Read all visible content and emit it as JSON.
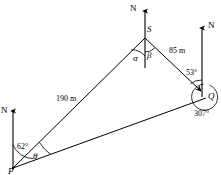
{
  "figure": {
    "type": "geometry-bearing-diagram"
  },
  "points": {
    "p": {
      "label": "P",
      "x": 13,
      "y": 168
    },
    "s": {
      "label": "S",
      "x": 145,
      "y": 38
    },
    "q": {
      "label": "Q",
      "x": 207,
      "y": 97
    }
  },
  "north_arrows": [
    {
      "name": "north-at-s",
      "label": "N",
      "x": 145,
      "tip_y": 8,
      "base_y": 68
    },
    {
      "name": "north-at-q",
      "label": "N",
      "x": 202,
      "tip_y": 25,
      "base_y": 97
    },
    {
      "name": "north-at-p",
      "label": "N",
      "x": 13,
      "tip_y": 108,
      "base_y": 168
    }
  ],
  "sides": [
    {
      "name": "side-ps",
      "from": "P",
      "to": "S",
      "length_label": "190 m"
    },
    {
      "name": "side-sq",
      "from": "S",
      "to": "Q",
      "length_label": "85 m"
    },
    {
      "name": "side-pq",
      "from": "P",
      "to": "Q",
      "length_label": ""
    }
  ],
  "lengths": {
    "ps": "190 m",
    "sq": "85 m"
  },
  "angles": {
    "alpha": "α",
    "beta": "β",
    "theta": "θ",
    "at_p_bearing": "62°",
    "at_q_bearing": "53°",
    "at_q_reflex": "307°"
  },
  "colors": {
    "stroke": "#000000",
    "background": "#ffffff"
  }
}
